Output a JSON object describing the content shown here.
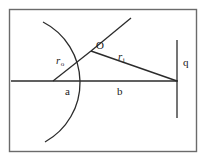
{
  "figure": {
    "background_color": "#ffffff",
    "stroke_color": "#1a1a1a",
    "frame_color": "#6b6b6b",
    "width": 211,
    "height": 164
  },
  "frame": {
    "name": "figure-border",
    "x": 9,
    "y": 9,
    "width": 188,
    "height": 143
  },
  "labels": {
    "r_source": {
      "base": "r",
      "subscript": "o"
    },
    "origin": {
      "text": "O"
    },
    "r_field": {
      "base": "r",
      "subscript": "j"
    },
    "segment_a": {
      "text": "a"
    },
    "segment_b": {
      "text": "b"
    },
    "charge_q": {
      "text": "q"
    }
  },
  "geometry": {
    "axis": {
      "name": "horizontal-axis",
      "x1": 11,
      "y1": 81,
      "x2": 178,
      "y2": 81
    },
    "arc": {
      "name": "circular-arc",
      "start_x": 43,
      "start_y": 22,
      "end_x": 45,
      "end_y": 142,
      "radius": 68,
      "bulge_direction": "right",
      "apex_x": 99,
      "apex_y": 82
    },
    "vertex": {
      "name": "intersection-point-O",
      "x": 91,
      "y": 51
    },
    "ray_r_source": {
      "name": "ray-r-source",
      "x1": 53,
      "y1": 81,
      "x2": 91,
      "y2": 51
    },
    "ray_diagonal_upper": {
      "name": "ray-diagonal-upper",
      "x1": 91,
      "y1": 51,
      "x2": 131,
      "y2": 18
    },
    "ray_r_field": {
      "name": "ray-r-field",
      "x1": 91,
      "y1": 51,
      "x2": 177,
      "y2": 81
    },
    "charge_line": {
      "name": "vertical-charge-line",
      "x": 177,
      "y1": 40,
      "y2": 118
    }
  }
}
